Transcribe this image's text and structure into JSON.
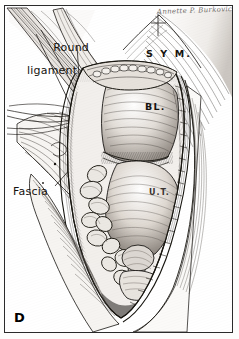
{
  "figure": {
    "panel_letter": "D",
    "signature": "Annette P. Burkovich",
    "medium": "pen-and-ink medical illustration",
    "view": "Pfannenstiel incision, abdominal cavity opened"
  },
  "labels": {
    "round_ligament": {
      "line1": "Round",
      "line2": "ligament"
    },
    "fascia": "Fascia",
    "symphysis": "S Y M.",
    "bladder": "BL.",
    "uterus": "U.T."
  },
  "colors": {
    "ink": "#15120f",
    "frame": "#2b2b2b",
    "paper": "#ffffff",
    "mid_tone": "#6e6a66",
    "shadow": "#2a2724"
  }
}
